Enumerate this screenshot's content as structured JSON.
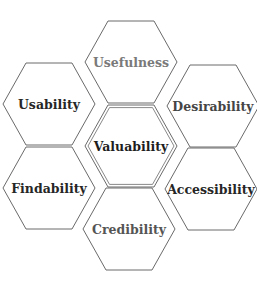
{
  "diagram": {
    "type": "honeycomb",
    "center": {
      "label": "Valuability",
      "color": "#1e1e1e"
    },
    "cells": [
      {
        "id": "usefulness",
        "label": "Usefulness",
        "color": "#7a7a7a",
        "cx": 131,
        "cy": 62
      },
      {
        "id": "usability",
        "label": "Usability",
        "color": "#262626",
        "cx": 49,
        "cy": 104
      },
      {
        "id": "desirability",
        "label": "Desirability",
        "color": "#454545",
        "cx": 213,
        "cy": 106
      },
      {
        "id": "valuability",
        "label": "Valuability",
        "color": "#1e1e1e",
        "cx": 131,
        "cy": 146
      },
      {
        "id": "findability",
        "label": "Findability",
        "color": "#262626",
        "cx": 49,
        "cy": 188
      },
      {
        "id": "accessibility",
        "label": "Accessibility",
        "color": "#262626",
        "cx": 211,
        "cy": 189
      },
      {
        "id": "credibility",
        "label": "Credibility",
        "color": "#555555",
        "cx": 129,
        "cy": 229
      }
    ],
    "stroke_color": "#6a6a6a",
    "background": "#ffffff"
  }
}
